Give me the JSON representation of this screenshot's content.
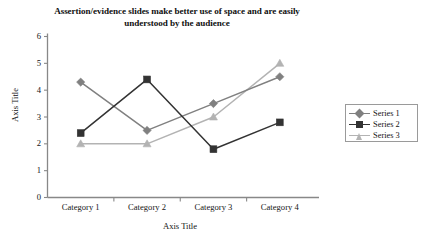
{
  "chart_data": {
    "type": "line",
    "title": "Assertion/evidence slides make better use of space and are easily understood by the audience",
    "title_line1": "Assertion/evidence slides make better use of space and are",
    "title_line2": "easily understood by the audience",
    "xlabel": "Axis Title",
    "ylabel": "Axis Title",
    "categories": [
      "Category 1",
      "Category 2",
      "Category 3",
      "Category 4"
    ],
    "ylim": [
      0,
      6
    ],
    "yticks": [
      0,
      1,
      2,
      3,
      4,
      5,
      6
    ],
    "grid": false,
    "legend_position": "right",
    "series": [
      {
        "name": "Series 1",
        "values": [
          4.3,
          2.5,
          3.5,
          4.5
        ],
        "color": "#808080",
        "marker": "diamond"
      },
      {
        "name": "Series 2",
        "values": [
          2.4,
          4.4,
          1.8,
          2.8
        ],
        "color": "#333333",
        "marker": "square"
      },
      {
        "name": "Series 3",
        "values": [
          2.0,
          2.0,
          3.0,
          5.0
        ],
        "color": "#b3b3b3",
        "marker": "triangle"
      }
    ]
  },
  "axis": {
    "line_color": "#888888"
  }
}
